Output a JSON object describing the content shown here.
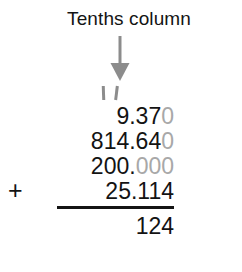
{
  "worksheet": {
    "heading": "Tenths column",
    "arrow": {
      "icon": "down-arrow-icon",
      "color": "#8c8c8c"
    },
    "tick_marks": {
      "icon": "tally-tick-marks-icon",
      "count": 2,
      "color": "#8c8c8c"
    },
    "operator": "+",
    "colors": {
      "digit": "#131313",
      "placeholder_digit": "#a8a8a8",
      "rule": "#141414",
      "background": "#ffffff"
    },
    "addends": [
      {
        "value": "9.370",
        "significant": "9.37",
        "padding_zeros": "0"
      },
      {
        "value": "814.640",
        "significant": "814.64",
        "padding_zeros": "0"
      },
      {
        "value": "200.000",
        "significant": "200.",
        "padding_zeros": "000"
      },
      {
        "value": "25.114",
        "significant": "25.114",
        "padding_zeros": ""
      }
    ],
    "answer": "124"
  }
}
